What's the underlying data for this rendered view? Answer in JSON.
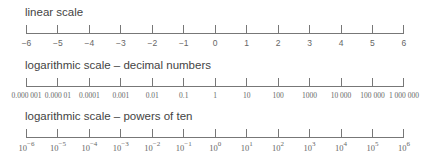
{
  "scales": [
    {
      "id": "linear",
      "title": "linear scale",
      "labels": [
        "−6",
        "−5",
        "−4",
        "−3",
        "−2",
        "−1",
        "0",
        "1",
        "2",
        "3",
        "4",
        "5",
        "6"
      ]
    },
    {
      "id": "decimal",
      "title": "logarithmic scale – decimal numbers",
      "labels": [
        "0.000001",
        "0.00001",
        "0.0001",
        "0.001",
        "0.01",
        "0.1",
        "1",
        "10",
        "100",
        "1000",
        "10000",
        "100000",
        "1000000"
      ]
    },
    {
      "id": "powers",
      "title": "logarithmic scale – powers of ten",
      "base": "10",
      "exponents": [
        "−6",
        "−5",
        "−4",
        "−3",
        "−2",
        "−1",
        "0",
        "1",
        "2",
        "3",
        "4",
        "5",
        "6"
      ]
    }
  ],
  "colors": {
    "axis": "#777777",
    "text": "#555555"
  }
}
